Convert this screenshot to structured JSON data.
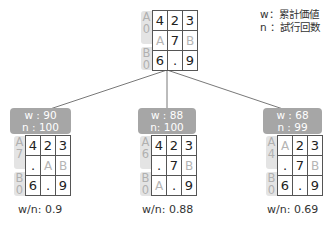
{
  "legend": {
    "w": "w：累計価値",
    "n": "n ：試行回数"
  },
  "root": {
    "tabs": [
      {
        "letter": "A",
        "count": "0"
      },
      {
        "letter": "B",
        "count": "0"
      }
    ],
    "cells": [
      [
        "4",
        "2",
        "3"
      ],
      [
        "A",
        "7",
        "B"
      ],
      [
        "6",
        ".",
        "9"
      ]
    ]
  },
  "children": [
    {
      "w": "w : 90",
      "n": "n : 100",
      "tabs": [
        {
          "letter": "A",
          "count": "7"
        },
        {
          "letter": "B",
          "count": "0"
        }
      ],
      "cells": [
        [
          "4",
          "2",
          "3"
        ],
        [
          ".",
          "A",
          "B"
        ],
        [
          "6",
          ".",
          "9"
        ]
      ],
      "ratio": "w/n: 0.9"
    },
    {
      "w": "w : 88",
      "n": "n: 100",
      "tabs": [
        {
          "letter": "A",
          "count": "6"
        },
        {
          "letter": "B",
          "count": "0"
        }
      ],
      "cells": [
        [
          "4",
          "2",
          "3"
        ],
        [
          ".",
          "7",
          "B"
        ],
        [
          "A",
          ".",
          "9"
        ]
      ],
      "ratio": "w/n: 0.88"
    },
    {
      "w": "w : 68",
      "n": "n : 99",
      "tabs": [
        {
          "letter": "A",
          "count": "4"
        },
        {
          "letter": "B",
          "count": "0"
        }
      ],
      "cells": [
        [
          "A",
          "2",
          "3"
        ],
        [
          ".",
          "7",
          "B"
        ],
        [
          "6",
          ".",
          "9"
        ]
      ],
      "ratio": "w/n: 0.69"
    }
  ],
  "colors": {
    "badge": "#a6a6a6",
    "tab": "#e4e4e4",
    "placeholder_text": "#b5b5b5",
    "edge": "#555555"
  }
}
